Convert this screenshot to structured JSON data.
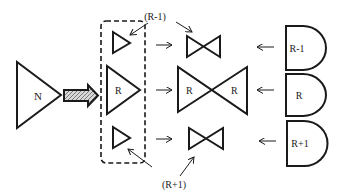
{
  "diagram": {
    "source_node": {
      "label": "N"
    },
    "group_nodes": [
      {
        "id": "r-minus-1",
        "label": ""
      },
      {
        "id": "r",
        "label": "R"
      },
      {
        "id": "r-plus-1",
        "label": ""
      }
    ],
    "bowties": [
      {
        "id": "bowtie-r-minus-1",
        "left_label": "",
        "right_label": ""
      },
      {
        "id": "bowtie-r",
        "left_label": "R",
        "right_label": "R"
      },
      {
        "id": "bowtie-r-plus-1",
        "left_label": "",
        "right_label": ""
      }
    ],
    "receivers": [
      {
        "id": "receiver-r-minus-1",
        "label": "R-1"
      },
      {
        "id": "receiver-r",
        "label": "R"
      },
      {
        "id": "receiver-r-plus-1",
        "label": "R+1"
      }
    ],
    "callouts": {
      "top": "(R-1)",
      "bottom": "(R+1)"
    },
    "colors": {
      "stroke": "#1a1a1a",
      "background": "#ffffff",
      "hatch": "#9a9a9a"
    }
  }
}
